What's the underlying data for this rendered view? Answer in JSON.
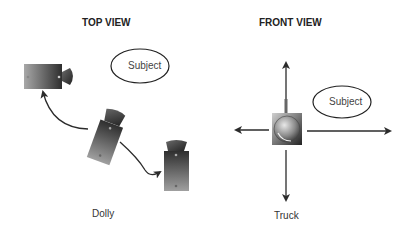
{
  "top_view": {
    "title": "TOP VIEW",
    "subject_label": "Subject",
    "caption": "Dolly"
  },
  "front_view": {
    "title": "FRONT VIEW",
    "subject_label": "Subject",
    "caption": "Truck"
  },
  "colors": {
    "camera_dark": "#2a2a2a",
    "camera_light": "#b0b0b0",
    "line": "#2b2b2b",
    "text": "#333333"
  }
}
